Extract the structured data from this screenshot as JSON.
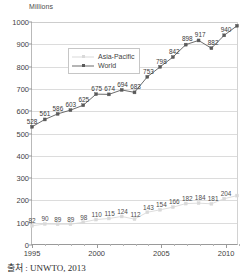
{
  "source_note": "출처 : UNWTO, 2013",
  "legend": {
    "position": "inside-top-left",
    "entries": [
      {
        "label": "Asia-Pacific",
        "color": "#d9d9d9",
        "marker": "square"
      },
      {
        "label": "World",
        "color": "#5a5a5a",
        "marker": "square"
      }
    ]
  },
  "chart_data": {
    "type": "line",
    "title": "",
    "subtitle": "",
    "xlabel": "",
    "ylabel": "Millions",
    "axis_title": "Millions",
    "grid": "horizontal",
    "ylim": [
      0,
      1000
    ],
    "ytick_labels": [
      "0",
      "100",
      "200",
      "300",
      "400",
      "500",
      "600",
      "700",
      "800",
      "900",
      "1000"
    ],
    "ytick_values": [
      0,
      100,
      200,
      300,
      400,
      500,
      600,
      700,
      800,
      900,
      1000
    ],
    "xlim": [
      1995,
      2011
    ],
    "xtick_labels": [
      "1995",
      "2000",
      "2005",
      "2010"
    ],
    "xtick_values": [
      1995,
      2000,
      2005,
      2010
    ],
    "x": [
      1995,
      1996,
      1997,
      1998,
      1999,
      2000,
      2001,
      2002,
      2003,
      2004,
      2005,
      2006,
      2007,
      2008,
      2009,
      2010,
      2011
    ],
    "series": [
      {
        "name": "World",
        "color": "#5a5a5a",
        "marker": "square",
        "labels_shown": true,
        "values": [
          528,
          561,
          586,
          603,
          625,
          675,
          674,
          694,
          683,
          753,
          798,
          842,
          898,
          917,
          882,
          940,
          983
        ],
        "value_labels": [
          "528",
          "561",
          "586",
          "603",
          "625",
          "675",
          "674",
          "694",
          "683",
          "753",
          "798",
          "842",
          "898",
          "917",
          "882",
          "940",
          ""
        ]
      },
      {
        "name": "Asia-Pacific",
        "color": "#d9d9d9",
        "marker": "square",
        "labels_shown": true,
        "values": [
          82,
          90,
          89,
          89,
          98,
          110,
          115,
          124,
          112,
          143,
          154,
          166,
          182,
          184,
          181,
          204,
          218
        ],
        "value_labels": [
          "82",
          "90",
          "89",
          "89",
          "98",
          "110",
          "115",
          "124",
          "112",
          "143",
          "154",
          "166",
          "182",
          "184",
          "181",
          "204",
          ""
        ]
      }
    ]
  }
}
